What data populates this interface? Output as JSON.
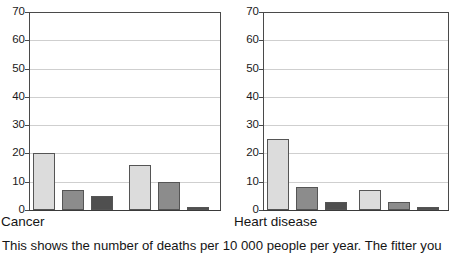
{
  "caption": "This shows the number of deaths per 10 000 people per year. The fitter you",
  "chart_data": {
    "type": "bar",
    "title": "",
    "xlabel": "",
    "ylabel": "",
    "ylim": [
      0,
      70
    ],
    "yticks": [
      0,
      10,
      20,
      30,
      40,
      50,
      60,
      70
    ],
    "grid": true,
    "legend": "none",
    "note": "Deaths per 10 000 people per year; two panels, each with two groups of three shaded bars",
    "panels": [
      {
        "label": "Cancer",
        "groups": [
          {
            "values": [
              20,
              7,
              5
            ]
          },
          {
            "values": [
              16,
              10,
              1
            ]
          }
        ],
        "series": [
          {
            "name": "light",
            "color": "#dcdcdc",
            "values": [
              20,
              16
            ]
          },
          {
            "name": "medium",
            "color": "#8c8c8c",
            "values": [
              7,
              10
            ]
          },
          {
            "name": "dark",
            "color": "#4f4f4f",
            "values": [
              5,
              1
            ]
          }
        ]
      },
      {
        "label": "Heart disease",
        "groups": [
          {
            "values": [
              25,
              8,
              3
            ]
          },
          {
            "values": [
              7,
              3,
              1
            ]
          }
        ],
        "series": [
          {
            "name": "light",
            "color": "#dcdcdc",
            "values": [
              25,
              7
            ]
          },
          {
            "name": "medium",
            "color": "#8c8c8c",
            "values": [
              8,
              3
            ]
          },
          {
            "name": "dark",
            "color": "#4f4f4f",
            "values": [
              3,
              1
            ]
          }
        ]
      }
    ]
  },
  "colors": {
    "light_bar": "#dcdcdc",
    "medium_bar": "#8c8c8c",
    "dark_bar": "#4f4f4f",
    "bar_outline": "#555555",
    "axis": "#3a3a3a",
    "gridline": "#cfcfcf",
    "background": "#ffffff",
    "text": "#151515"
  }
}
